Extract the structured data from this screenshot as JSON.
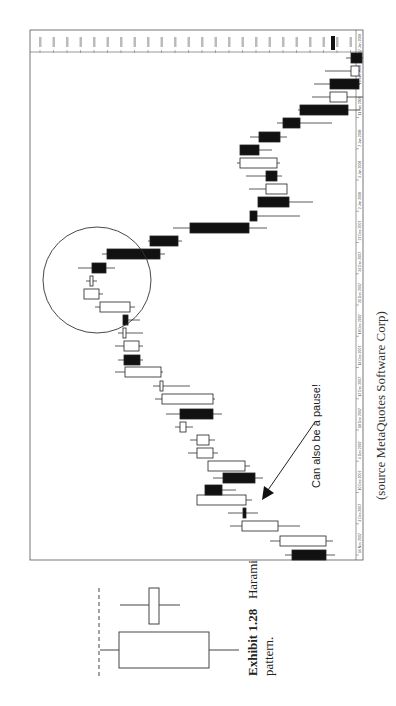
{
  "caption": {
    "exhibit": "Exhibit 1.28",
    "title": "Harami",
    "title_cont": "pattern."
  },
  "source": "(source MetaQuotes Software Corp)",
  "annotation": "Can also be a pause!",
  "chart_header": "GBPUSD,Daily  ...",
  "chart_data": {
    "type": "candlestick",
    "title": "",
    "orientation": "rotated 90° counter-clockwise (time runs bottom→top, price right→left)",
    "x_axis": {
      "label": "Date",
      "tick_labels": [
        "16 Nov 2007",
        "3 Dec 2007",
        "10 Dec 2007",
        "4 Dec 2007",
        "18 Dec 2007",
        "12 Dec 2007",
        "14 Dec 2007",
        "18 Dec 2007",
        "21 Dec 2007",
        "24 Dec 2007",
        "27 Dec 2007",
        "2 Jan 2008",
        "3 Jan 2008",
        "7 Jan 2008",
        "11 Jan 2008",
        "15 Jan 2008",
        "17 Jan 2008"
      ]
    },
    "y_axis": {
      "label": "Price",
      "position": "top edge",
      "grid": false
    },
    "annotations": [
      {
        "type": "circle",
        "label": "harami area highlighted"
      },
      {
        "type": "arrow",
        "text": "Can also be a pause!"
      }
    ],
    "candles": [
      {
        "y": 555,
        "body": [
          292,
          326
        ],
        "wick": [
          285,
          335
        ],
        "fill": "black"
      },
      {
        "y": 541,
        "body": [
          280,
          326
        ],
        "wick": [
          270,
          333
        ],
        "fill": "white"
      },
      {
        "y": 526,
        "body": [
          242,
          278
        ],
        "wick": [
          230,
          300
        ],
        "fill": "white"
      },
      {
        "y": 513,
        "body": [
          243,
          246
        ],
        "wick": [
          228,
          258
        ],
        "fill": "black"
      },
      {
        "y": 500,
        "body": [
          197,
          246
        ],
        "wick": [
          197,
          252
        ],
        "fill": "white"
      },
      {
        "y": 490,
        "body": [
          205,
          222
        ],
        "wick": [
          205,
          236
        ],
        "fill": "black"
      },
      {
        "y": 478,
        "body": [
          223,
          255
        ],
        "wick": [
          213,
          263
        ],
        "fill": "black"
      },
      {
        "y": 466,
        "body": [
          208,
          245
        ],
        "wick": [
          208,
          250
        ],
        "fill": "white"
      },
      {
        "y": 453,
        "body": [
          197,
          213
        ],
        "wick": [
          188,
          218
        ],
        "fill": "white"
      },
      {
        "y": 440,
        "body": [
          197,
          209
        ],
        "wick": [
          190,
          215
        ],
        "fill": "white"
      },
      {
        "y": 427,
        "body": [
          180,
          186
        ],
        "wick": [
          175,
          193
        ],
        "fill": "white"
      },
      {
        "y": 414,
        "body": [
          180,
          213
        ],
        "wick": [
          166,
          222
        ],
        "fill": "black"
      },
      {
        "y": 399,
        "body": [
          162,
          213
        ],
        "wick": [
          155,
          215
        ],
        "fill": "white"
      },
      {
        "y": 386,
        "body": [
          160,
          163
        ],
        "wick": [
          153,
          190
        ],
        "fill": "white"
      },
      {
        "y": 372,
        "body": [
          125,
          161
        ],
        "wick": [
          115,
          163
        ],
        "fill": "white"
      },
      {
        "y": 360,
        "body": [
          124,
          140
        ],
        "wick": [
          118,
          143
        ],
        "fill": "black"
      },
      {
        "y": 346,
        "body": [
          124,
          139
        ],
        "wick": [
          115,
          143
        ],
        "fill": "white"
      },
      {
        "y": 333,
        "body": [
          123,
          126
        ],
        "wick": [
          118,
          143
        ],
        "fill": "white"
      },
      {
        "y": 320,
        "body": [
          123,
          128
        ],
        "wick": [
          123,
          140
        ],
        "fill": "black"
      },
      {
        "y": 307,
        "body": [
          100,
          130
        ],
        "wick": [
          95,
          135
        ],
        "fill": "white"
      },
      {
        "y": 294,
        "body": [
          84,
          99
        ],
        "wick": [
          84,
          103
        ],
        "fill": "white"
      },
      {
        "y": 281,
        "body": [
          90,
          93
        ],
        "wick": [
          86,
          97
        ],
        "fill": "white"
      },
      {
        "y": 268,
        "body": [
          92,
          106
        ],
        "wick": [
          78,
          115
        ],
        "fill": "black"
      },
      {
        "y": 254,
        "body": [
          107,
          160
        ],
        "wick": [
          102,
          165
        ],
        "fill": "black"
      },
      {
        "y": 241,
        "body": [
          150,
          178
        ],
        "wick": [
          148,
          182
        ],
        "fill": "black"
      },
      {
        "y": 228,
        "body": [
          190,
          249
        ],
        "wick": [
          173,
          267
        ],
        "fill": "black"
      },
      {
        "y": 216,
        "body": [
          250,
          257
        ],
        "wick": [
          250,
          300
        ],
        "fill": "black"
      },
      {
        "y": 202,
        "body": [
          258,
          289
        ],
        "wick": [
          258,
          313
        ],
        "fill": "black"
      },
      {
        "y": 189,
        "body": [
          266,
          287
        ],
        "wick": [
          249,
          287
        ],
        "fill": "white"
      },
      {
        "y": 176,
        "body": [
          266,
          277
        ],
        "wick": [
          246,
          282
        ],
        "fill": "black"
      },
      {
        "y": 163,
        "body": [
          240,
          277
        ],
        "wick": [
          237,
          280
        ],
        "fill": "white"
      },
      {
        "y": 150,
        "body": [
          240,
          259
        ],
        "wick": [
          240,
          272
        ],
        "fill": "black"
      },
      {
        "y": 137,
        "body": [
          259,
          280
        ],
        "wick": [
          250,
          287
        ],
        "fill": "black"
      },
      {
        "y": 123,
        "body": [
          283,
          300
        ],
        "wick": [
          277,
          332
        ],
        "fill": "black"
      },
      {
        "y": 110,
        "body": [
          300,
          348
        ],
        "wick": [
          298,
          360
        ],
        "fill": "black"
      },
      {
        "y": 97,
        "body": [
          330,
          347
        ],
        "wick": [
          312,
          363
        ],
        "fill": "white"
      },
      {
        "y": 84,
        "body": [
          330,
          359
        ],
        "wick": [
          314,
          360
        ],
        "fill": "black"
      },
      {
        "y": 71,
        "body": [
          351,
          359
        ],
        "wick": [
          325,
          360
        ],
        "fill": "white"
      },
      {
        "y": 58,
        "body": [
          351,
          362
        ],
        "wick": [
          346,
          363
        ],
        "fill": "black"
      }
    ]
  },
  "harami_diagram": {
    "large_body": {
      "x": [
        120,
        210
      ],
      "y": [
        633,
        668
      ]
    },
    "large_wick": {
      "x": [
        100,
        240
      ],
      "y": 650
    },
    "small_body": {
      "x": [
        150,
        160
      ],
      "y": [
        588,
        624
      ]
    },
    "small_wick": {
      "x": [
        120,
        180
      ],
      "y": 605
    },
    "dashed_line_x": 99
  }
}
